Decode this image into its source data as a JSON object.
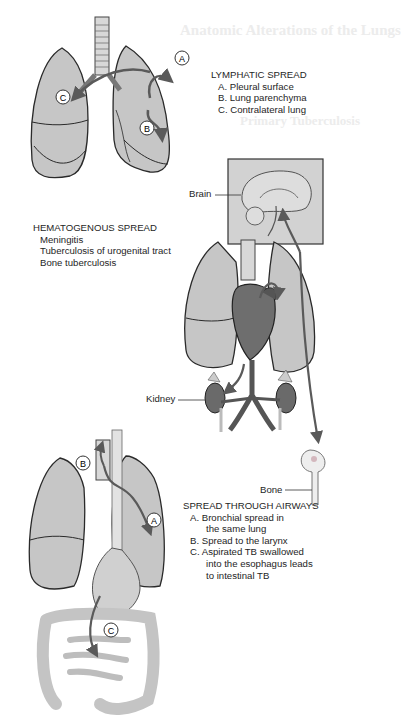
{
  "background_text": {
    "heading": "Anatomic Alterations of the Lungs",
    "subheading": "Primary Tuberculosis"
  },
  "lymphatic": {
    "title": "LYMPHATIC SPREAD",
    "items": [
      "A. Pleural surface",
      "B. Lung parenchyma",
      "C. Contralateral lung"
    ],
    "markers": [
      "A",
      "B",
      "C"
    ]
  },
  "hematogenous": {
    "title": "HEMATOGENOUS SPREAD",
    "items": [
      "Meningitis",
      "Tuberculosis of urogenital tract",
      "Bone tuberculosis"
    ],
    "labels": {
      "brain": "Brain",
      "kidney": "Kidney",
      "bone": "Bone"
    }
  },
  "airways": {
    "title": "SPREAD THROUGH AIRWAYS",
    "item_a": "A. Bronchial spread in",
    "item_a_cont": "the same lung",
    "item_b": "B. Spread to the larynx",
    "item_c": "C. Aspirated TB swallowed",
    "item_c_cont1": "into the esophagus leads",
    "item_c_cont2": "to intestinal TB",
    "markers": [
      "A",
      "B",
      "C"
    ]
  },
  "colors": {
    "lung_fill": "#c8c8c8",
    "outline": "#2a2a2a",
    "arrow": "#5a5a5a",
    "heart": "#6e6e6e",
    "brain_box": "#d2d2d2"
  }
}
